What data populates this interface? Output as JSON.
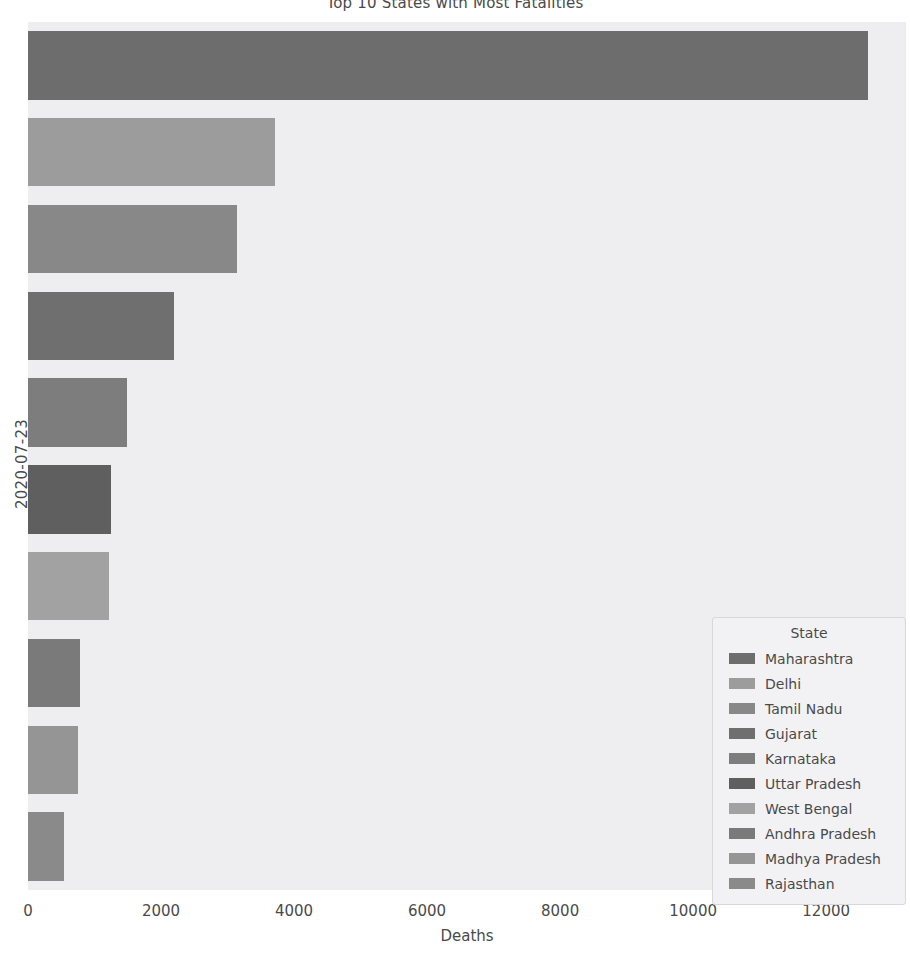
{
  "chart_data": {
    "type": "bar",
    "orientation": "horizontal",
    "title": "Top 10 States with Most Fatalities",
    "xlabel": "Deaths",
    "ylabel": "2020-07-23",
    "xlim": [
      0,
      13200
    ],
    "xticks": [
      0,
      2000,
      4000,
      6000,
      8000,
      10000,
      12000
    ],
    "xticklabels": [
      "0",
      "2000",
      "4000",
      "6000",
      "8000",
      "10000",
      "12000"
    ],
    "grid": false,
    "legend_title": "State",
    "legend_position": "lower right",
    "categories": [
      "Maharashtra",
      "Delhi",
      "Tamil Nadu",
      "Gujarat",
      "Karnataka",
      "Uttar Pradesh",
      "West Bengal",
      "Andhra Pradesh",
      "Madhya Pradesh",
      "Rajasthan"
    ],
    "values": [
      12632,
      3719,
      3144,
      2198,
      1488,
      1250,
      1221,
      783,
      752,
      548
    ],
    "colors": [
      "#6d6d6d",
      "#9c9c9c",
      "#888888",
      "#6f6f6f",
      "#7d7d7d",
      "#5f5f5f",
      "#a2a2a2",
      "#7a7a7a",
      "#959595",
      "#8a8a8a"
    ]
  },
  "legend": {
    "title": "State",
    "items": [
      {
        "label": "Maharashtra",
        "color": "#6d6d6d"
      },
      {
        "label": "Delhi",
        "color": "#9c9c9c"
      },
      {
        "label": "Tamil Nadu",
        "color": "#888888"
      },
      {
        "label": "Gujarat",
        "color": "#6f6f6f"
      },
      {
        "label": "Karnataka",
        "color": "#7d7d7d"
      },
      {
        "label": "Uttar Pradesh",
        "color": "#5f5f5f"
      },
      {
        "label": "West Bengal",
        "color": "#a2a2a2"
      },
      {
        "label": "Andhra Pradesh",
        "color": "#7a7a7a"
      },
      {
        "label": "Madhya Pradesh",
        "color": "#959595"
      },
      {
        "label": "Rajasthan",
        "color": "#8a8a8a"
      }
    ]
  },
  "style": {
    "figure_background": "#ffffff",
    "axes_background": "#eeeef1",
    "text_color": "#4a4a4a"
  }
}
